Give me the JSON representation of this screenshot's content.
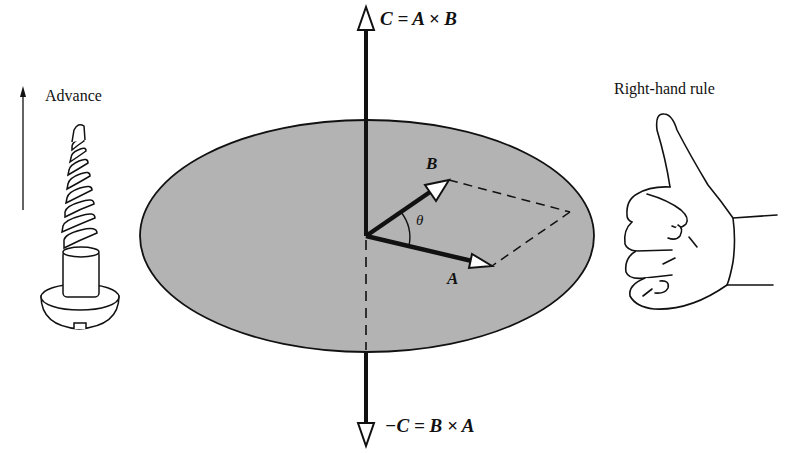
{
  "diagram": {
    "labels": {
      "top_equation": "C = A × B",
      "bottom_equation": "−C = B × A",
      "screw_caption": "Advance",
      "hand_caption": "Right-hand rule",
      "vector_a": "A",
      "vector_b": "B",
      "angle": "θ"
    },
    "colors": {
      "plane_fill": "#b3b3b3",
      "stroke": "#111111",
      "background": "#ffffff"
    },
    "elements": [
      {
        "id": "plane",
        "type": "ellipse",
        "description": "shaded plane containing A and B"
      },
      {
        "id": "vector-c",
        "type": "arrow",
        "direction": "up",
        "label": "C = A × B"
      },
      {
        "id": "vector-neg-c",
        "type": "arrow",
        "direction": "down",
        "label": "−C = B × A"
      },
      {
        "id": "vector-a",
        "type": "arrow",
        "label": "A"
      },
      {
        "id": "vector-b",
        "type": "arrow",
        "label": "B"
      },
      {
        "id": "parallelogram",
        "type": "dashed-lines",
        "description": "parallelogram spanned by A and B"
      },
      {
        "id": "angle-arc",
        "type": "arc",
        "label": "θ"
      },
      {
        "id": "screw",
        "type": "illustration",
        "label": "Advance"
      },
      {
        "id": "hand",
        "type": "illustration",
        "label": "Right-hand rule"
      }
    ]
  }
}
